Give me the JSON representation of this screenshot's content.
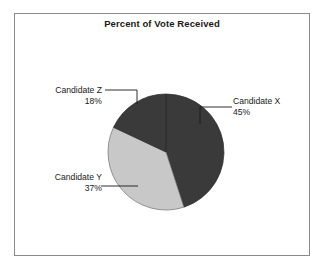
{
  "chart": {
    "title": "Percent of Vote Received",
    "frame_color": "#8a8a8a",
    "background": "#ffffff"
  },
  "chart_data": {
    "type": "pie",
    "title": "Percent of Vote Received",
    "xlabel": "",
    "ylabel": "",
    "categories": [
      "Candidate X",
      "Candidate Y",
      "Candidate Z"
    ],
    "values": [
      45,
      37,
      18
    ],
    "value_unit": "%",
    "start_angle_deg": 0,
    "direction": "clockwise",
    "legend": "none",
    "grid": false,
    "slices": [
      {
        "label": "Candidate X",
        "value": 45,
        "value_label": "45%",
        "color": "#3a3a3a",
        "start_deg": 0,
        "end_deg": 162
      },
      {
        "label": "Candidate Y",
        "value": 37,
        "value_label": "37%",
        "color": "#c8c8c8",
        "start_deg": 162,
        "end_deg": 295.2
      },
      {
        "label": "Candidate Z",
        "value": 18,
        "value_label": "18%",
        "color": "#3a3a3a",
        "start_deg": 295.2,
        "end_deg": 360
      }
    ]
  },
  "callouts": {
    "x": {
      "name": "Candidate X",
      "percent": "45%"
    },
    "y": {
      "name": "Candidate Y",
      "percent": "37%"
    },
    "z": {
      "name": "Candidate Z",
      "percent": "18%"
    }
  }
}
